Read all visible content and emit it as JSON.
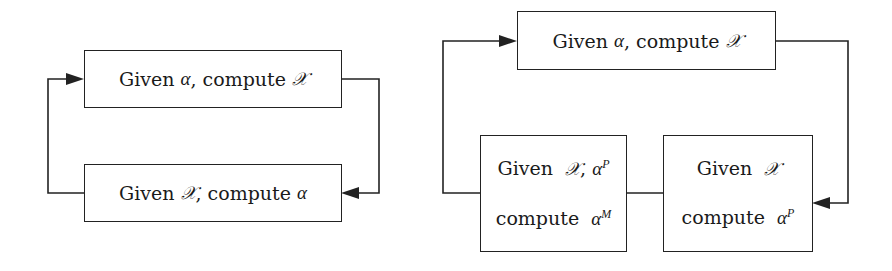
{
  "diagrams": {
    "left": {
      "top_box": {
        "prefix": "Given ",
        "given_sym": "α",
        "mid": ", compute ",
        "compute_sym": "𝒳"
      },
      "bottom_box": {
        "prefix": "Given ",
        "given_sym": "𝒳",
        "mid": ", compute ",
        "compute_sym": "α"
      }
    },
    "right": {
      "top_box": {
        "prefix": "Given ",
        "given_sym": "α",
        "mid": ", compute ",
        "compute_sym": "𝒳"
      },
      "bottom_left_box": {
        "line1_prefix": "Given ",
        "line1_sym1": "𝒳",
        "line1_sep": ", ",
        "line1_sym2": "α",
        "line1_sup": "P",
        "line2_prefix": "compute ",
        "line2_sym": "α",
        "line2_sup": "M"
      },
      "bottom_right_box": {
        "line1_prefix": "Given ",
        "line1_sym": "𝒳",
        "line2_prefix": "compute ",
        "line2_sym": "α",
        "line2_sup": "P"
      }
    }
  },
  "colors": {
    "stroke": "#222222",
    "background": "#ffffff"
  }
}
